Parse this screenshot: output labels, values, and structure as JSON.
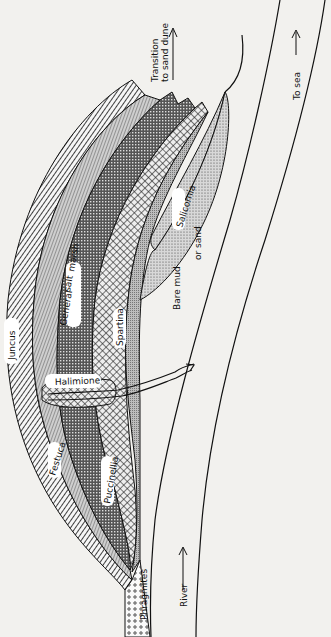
{
  "figure": {
    "zones": [
      {
        "id": "juncus",
        "label": "Juncus"
      },
      {
        "id": "festuca",
        "label": "Festuca"
      },
      {
        "id": "general-salt-marsh",
        "label_line1": "General",
        "label_line2": "salt",
        "label_line3": "marsh"
      },
      {
        "id": "puccinellia",
        "label": "Puccinellia"
      },
      {
        "id": "halimione",
        "label": "Halimione"
      },
      {
        "id": "spartina",
        "label": "Spartina"
      },
      {
        "id": "salicornia",
        "label": "Salicornia"
      },
      {
        "id": "phragmites",
        "label": "Phragmites"
      }
    ],
    "annotations": {
      "transition_line1": "Transition",
      "transition_line2": "to sand dune",
      "to_sea": "To sea",
      "bare_mud_line1": "Bare mud",
      "bare_mud_line2": "or sand",
      "river": "River"
    },
    "colors": {
      "ink": "#111111",
      "paper": "#f2f1ee"
    }
  }
}
